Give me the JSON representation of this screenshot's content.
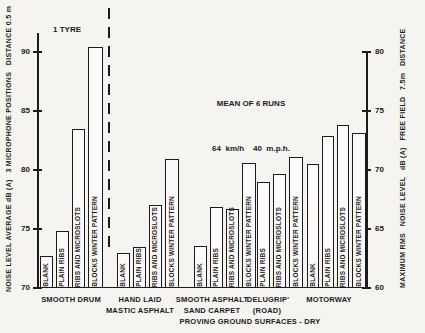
{
  "figure": {
    "tyre_note": "1 TYRE",
    "annotation_line1": "MEAN OF 6 RUNS",
    "annotation_line2": "64  km/h    40  m.p.h.",
    "caption": "PROVING GROUND SURFACES - DRY"
  },
  "chart_data": {
    "type": "bar",
    "left_axis": {
      "label": "NOISE LEVEL AVERAGE dB (A)   3 MICROPHONE POSITIONS   DISTANCE 0.5 m",
      "ticks": [
        90,
        85,
        80,
        75,
        70
      ],
      "range": [
        70,
        91.5
      ]
    },
    "right_axis": {
      "label": "MAXIMUM RMS   NOISE LEVEL   dB (A)   FREE FIELD   7.5m   DISTANCE",
      "ticks": [
        80,
        75,
        70,
        65,
        60
      ],
      "range": [
        60,
        80
      ]
    },
    "grid": "off",
    "groups": [
      {
        "surface": [
          "SMOOTH DRUM"
        ],
        "scale": "left",
        "bars": [
          {
            "tyre": "BLANK",
            "value": 72.7
          },
          {
            "tyre": "PLAIN RIBS",
            "value": 74.8
          },
          {
            "tyre": "RIBS AND MICROSLOTS",
            "value": 83.5
          },
          {
            "tyre": "BLOCKS WINTER PATTERN",
            "value": 90.4
          }
        ]
      },
      {
        "surface": [
          "HAND LAID",
          "MASTIC ASPHALT"
        ],
        "scale": "right",
        "bars": [
          {
            "tyre": "BLANK",
            "value": 63.0
          },
          {
            "tyre": "PLAIN RIBS",
            "value": 63.5
          },
          {
            "tyre": "RIBS AND MICROSLOTS",
            "value": 67.0
          },
          {
            "tyre": "BLOCKS WINTER PATTERN",
            "value": 70.9
          }
        ]
      },
      {
        "surface": [
          "SMOOTH ASPHALT",
          "SAND CARPET"
        ],
        "scale": "right",
        "bars": [
          {
            "tyre": "BLANK",
            "value": 63.6
          },
          {
            "tyre": "PLAIN RIBS",
            "value": 66.9
          },
          {
            "tyre": "RIBS AND MICROSLOTS",
            "value": 66.7
          },
          {
            "tyre": "BLOCKS WINTER PATTERN",
            "value": 70.6
          }
        ]
      },
      {
        "surface": [
          "'DELUGRIP'",
          "(ROAD)"
        ],
        "scale": "right",
        "bars": [
          {
            "tyre": "PLAIN RIBS",
            "value": 69.0
          },
          {
            "tyre": "RIBS AND MICROSLOTS",
            "value": 69.7
          },
          {
            "tyre": "BLOCKS WINTER PATTERN",
            "value": 71.1
          }
        ]
      },
      {
        "surface": [
          "MOTORWAY"
        ],
        "scale": "right",
        "bars": [
          {
            "tyre": "BLANK",
            "value": 70.5
          },
          {
            "tyre": "PLAIN RIBS",
            "value": 72.9
          },
          {
            "tyre": "RIBS AND MICROSLOTS",
            "value": 73.8
          },
          {
            "tyre": "BLOCKS WINTER PATTERN",
            "value": 73.1
          }
        ]
      }
    ]
  }
}
